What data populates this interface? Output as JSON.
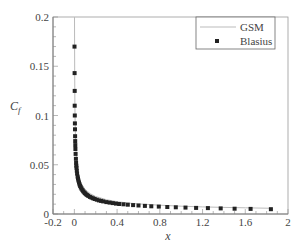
{
  "chart_data": {
    "type": "line",
    "title": "",
    "xlabel": "x",
    "ylabel": "C_f",
    "xlim": [
      -0.2,
      2
    ],
    "ylim": [
      0,
      0.2
    ],
    "xticks": [
      "-0.2",
      "0",
      "0.4",
      "0.8",
      "1.2",
      "1.6",
      "2"
    ],
    "xtick_values": [
      -0.2,
      0,
      0.4,
      0.8,
      1.2,
      1.6,
      2
    ],
    "yticks": [
      "0",
      "0.05",
      "0.1",
      "0.15",
      "0.2"
    ],
    "ytick_values": [
      0,
      0.05,
      0.1,
      0.15,
      0.2
    ],
    "grid": false,
    "legend_position": "upper right",
    "series": [
      {
        "name": "GSM",
        "style": "line",
        "color": "#bbbbbb",
        "x": [
          0.0015,
          0.002,
          0.003,
          0.004,
          0.005,
          0.007,
          0.01,
          0.015,
          0.02,
          0.03,
          0.04,
          0.05,
          0.07,
          0.1,
          0.15,
          0.2,
          0.3,
          0.4,
          0.5,
          0.6,
          0.8,
          1.0,
          1.2,
          1.4,
          1.6,
          1.85
        ],
        "values": [
          0.2,
          0.17,
          0.143,
          0.125,
          0.11,
          0.095,
          0.079,
          0.064,
          0.056,
          0.045,
          0.039,
          0.035,
          0.03,
          0.025,
          0.0205,
          0.0178,
          0.0145,
          0.0125,
          0.0112,
          0.0103,
          0.0089,
          0.0079,
          0.0072,
          0.0067,
          0.0063,
          0.0058
        ]
      },
      {
        "name": "Blasius",
        "style": "square-markers",
        "color": "#222222",
        "x": [
          0.0015,
          0.002,
          0.0028,
          0.0036,
          0.0044,
          0.0052,
          0.006,
          0.007,
          0.008,
          0.009,
          0.01,
          0.012,
          0.014,
          0.016,
          0.018,
          0.02,
          0.023,
          0.026,
          0.03,
          0.034,
          0.038,
          0.043,
          0.048,
          0.054,
          0.06,
          0.067,
          0.075,
          0.083,
          0.092,
          0.1,
          0.11,
          0.12,
          0.13,
          0.145,
          0.16,
          0.175,
          0.19,
          0.21,
          0.23,
          0.25,
          0.27,
          0.3,
          0.33,
          0.36,
          0.39,
          0.42,
          0.46,
          0.5,
          0.55,
          0.6,
          0.66,
          0.72,
          0.79,
          0.87,
          0.95,
          1.04,
          1.14,
          1.25,
          1.37,
          1.5,
          1.65,
          1.84
        ],
        "values": [
          0.17,
          0.143,
          0.125,
          0.11,
          0.1,
          0.092,
          0.086,
          0.079,
          0.074,
          0.07,
          0.066,
          0.061,
          0.056,
          0.052,
          0.049,
          0.047,
          0.044,
          0.041,
          0.038,
          0.036,
          0.034,
          0.032,
          0.03,
          0.0285,
          0.027,
          0.0257,
          0.0243,
          0.023,
          0.0219,
          0.021,
          0.02,
          0.0192,
          0.0184,
          0.0174,
          0.0166,
          0.0159,
          0.0152,
          0.0145,
          0.0138,
          0.0133,
          0.0128,
          0.0121,
          0.0116,
          0.0111,
          0.0106,
          0.0102,
          0.0098,
          0.0094,
          0.009,
          0.0086,
          0.0082,
          0.0078,
          0.0075,
          0.0071,
          0.0068,
          0.0065,
          0.0062,
          0.006,
          0.0057,
          0.0054,
          0.0052,
          0.0049
        ]
      }
    ]
  },
  "legend": {
    "items": [
      {
        "label": "GSM"
      },
      {
        "label": "Blasius"
      }
    ]
  },
  "axes": {
    "xlabel": "x",
    "ylabel_main": "C",
    "ylabel_sub": "f"
  }
}
